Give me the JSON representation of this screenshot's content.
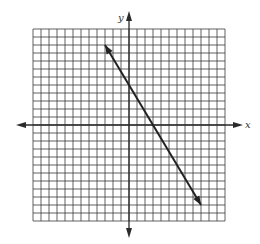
{
  "chart_data": {
    "type": "line",
    "title": "",
    "xlabel": "x",
    "ylabel": "y",
    "grid": true,
    "xlim": [
      -12,
      12
    ],
    "ylim": [
      -12,
      12
    ],
    "tick_labels": [],
    "legend": [],
    "series": [
      {
        "name": "line",
        "equation": "y = -5/3 x + 5",
        "slope": -1.6667,
        "y_intercept": 5,
        "x_intercept": 3,
        "x": [
          -3,
          0,
          3,
          9
        ],
        "y": [
          10,
          5,
          0,
          -10
        ],
        "arrows": "both"
      }
    ]
  },
  "labels": {
    "x_axis": "x",
    "y_axis": "y"
  },
  "colors": {
    "grid": "#3a3a3a",
    "axes": "#2a2a2a",
    "line": "#222222"
  }
}
